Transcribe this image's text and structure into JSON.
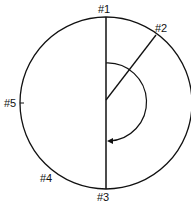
{
  "diagram": {
    "labels": {
      "p1": "#1",
      "p2": "#2",
      "p3": "#3",
      "p4": "#4",
      "p5": "#5"
    },
    "colors": {
      "stroke": "#111111",
      "background": "#ffffff"
    }
  }
}
